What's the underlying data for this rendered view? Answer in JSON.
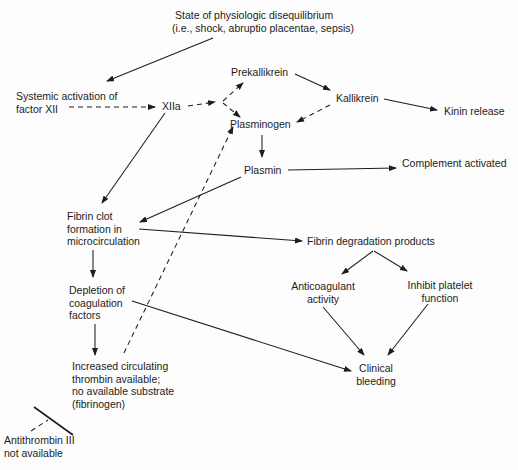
{
  "diagram": {
    "nodes": {
      "disequilibrium": {
        "lines": [
          "State of physiologic disequilibrium",
          "(i.e., shock, abruptio placentae, sepsis)"
        ]
      },
      "systemic_activation": {
        "lines": [
          "Systemic activation of",
          "factor XII"
        ]
      },
      "xiia": {
        "lines": [
          "XIIa"
        ]
      },
      "prekallikrein": {
        "lines": [
          "Prekallikrein"
        ]
      },
      "kallikrein": {
        "lines": [
          "Kallikrein"
        ]
      },
      "kinin_release": {
        "lines": [
          "Kinin release"
        ]
      },
      "plasminogen": {
        "lines": [
          "Plasminogen"
        ]
      },
      "plasmin": {
        "lines": [
          "Plasmin"
        ]
      },
      "complement": {
        "lines": [
          "Complement activated"
        ]
      },
      "fibrin_clot": {
        "lines": [
          "Fibrin clot",
          "formation in",
          "microcirculation"
        ]
      },
      "fdp": {
        "lines": [
          "Fibrin degradation products"
        ]
      },
      "anticoagulant": {
        "lines": [
          "Anticoagulant",
          "activity"
        ]
      },
      "inhibit_platelet": {
        "lines": [
          "Inhibit platelet",
          "function"
        ]
      },
      "depletion": {
        "lines": [
          "Depletion of",
          "coagulation",
          "factors"
        ]
      },
      "thrombin": {
        "lines": [
          "Increased circulating",
          "thrombin available;",
          "no available substrate",
          "(fibrinogen)"
        ]
      },
      "clinical_bleeding": {
        "lines": [
          "Clinical",
          "bleeding"
        ]
      },
      "antithrombin": {
        "lines": [
          "Antithrombin III",
          "not available"
        ]
      }
    },
    "edges": [
      {
        "from": "disequilibrium",
        "to": "systemic_activation",
        "style": "solid"
      },
      {
        "from": "systemic_activation",
        "to": "xiia",
        "style": "dashed"
      },
      {
        "from": "xiia",
        "to": "prekallikrein",
        "style": "dashed"
      },
      {
        "from": "xiia",
        "to": "plasminogen",
        "style": "dashed"
      },
      {
        "from": "prekallikrein",
        "to": "kallikrein",
        "style": "solid"
      },
      {
        "from": "kallikrein",
        "to": "kinin_release",
        "style": "solid"
      },
      {
        "from": "kallikrein",
        "to": "plasminogen",
        "style": "dashed"
      },
      {
        "from": "plasminogen",
        "to": "plasmin",
        "style": "solid"
      },
      {
        "from": "plasmin",
        "to": "complement",
        "style": "solid"
      },
      {
        "from": "plasmin",
        "to": "fibrin_clot",
        "style": "solid"
      },
      {
        "from": "xiia",
        "to": "fibrin_clot",
        "style": "solid"
      },
      {
        "from": "fibrin_clot",
        "to": "fdp",
        "style": "solid"
      },
      {
        "from": "fibrin_clot",
        "to": "depletion",
        "style": "solid"
      },
      {
        "from": "fdp",
        "to": "anticoagulant",
        "style": "solid"
      },
      {
        "from": "fdp",
        "to": "inhibit_platelet",
        "style": "solid"
      },
      {
        "from": "anticoagulant",
        "to": "clinical_bleeding",
        "style": "solid"
      },
      {
        "from": "inhibit_platelet",
        "to": "clinical_bleeding",
        "style": "solid"
      },
      {
        "from": "depletion",
        "to": "clinical_bleeding",
        "style": "solid"
      },
      {
        "from": "depletion",
        "to": "thrombin",
        "style": "solid"
      },
      {
        "from": "thrombin",
        "to": "plasminogen",
        "style": "dashed"
      },
      {
        "from": "antithrombin",
        "to": "thrombin",
        "style": "inhibition-dashed"
      }
    ]
  }
}
